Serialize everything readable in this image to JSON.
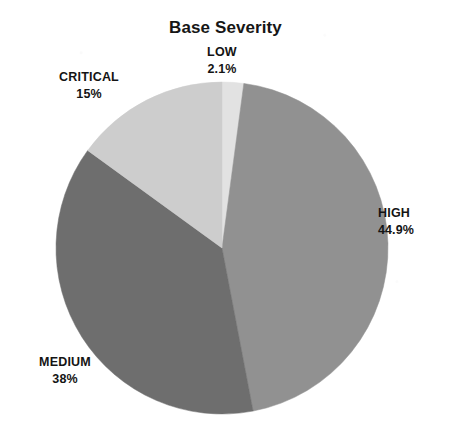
{
  "chart_data": {
    "type": "pie",
    "title": "Base Severity",
    "categories": [
      "LOW",
      "HIGH",
      "MEDIUM",
      "CRITICAL"
    ],
    "values": [
      2.1,
      44.9,
      38,
      15
    ],
    "value_labels": [
      "2.1%",
      "44.9%",
      "38%",
      "15%"
    ],
    "units": "percent",
    "start_angle_deg": 0,
    "direction": "clockwise",
    "legend": "none",
    "labels_position": "outside",
    "grid": false,
    "slice_colors": [
      "#e2e2e2",
      "#919191",
      "#6e6e6e",
      "#cdcdcd"
    ],
    "background_color": "#ffffff",
    "text_color": "#141414",
    "geometry": {
      "center_x": 222,
      "center_y": 248,
      "radius": 166
    },
    "slices": [
      {
        "name": "LOW",
        "value": 2.1,
        "label": "2.1%",
        "color": "#e2e2e2"
      },
      {
        "name": "HIGH",
        "value": 44.9,
        "label": "44.9%",
        "color": "#919191"
      },
      {
        "name": "MEDIUM",
        "value": 38,
        "label": "38%",
        "color": "#6e6e6e"
      },
      {
        "name": "CRITICAL",
        "value": 15,
        "label": "15%",
        "color": "#cdcdcd"
      }
    ]
  }
}
